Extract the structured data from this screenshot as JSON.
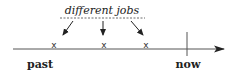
{
  "diagram": {
    "annotation": "different jobs",
    "job_marks": [
      {
        "label": "x",
        "x": 54
      },
      {
        "label": "x",
        "x": 104
      },
      {
        "label": "x",
        "x": 146
      }
    ],
    "axis": {
      "start_label": "past",
      "end_label": "now"
    },
    "colors": {
      "line": "#555555",
      "text": "#222222"
    }
  }
}
